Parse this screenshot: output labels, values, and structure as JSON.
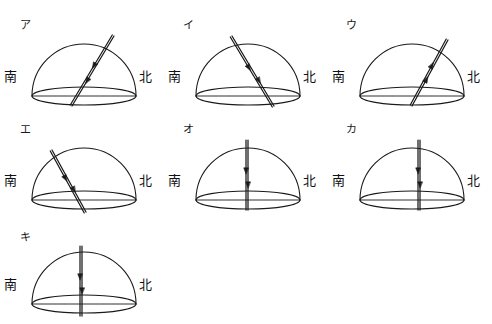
{
  "figure": {
    "title": "",
    "background_color": "#ffffff",
    "stroke_color": "#1a1a1a",
    "sheet_width": 492,
    "sheet_height": 324,
    "direction_labels": {
      "south": "南",
      "north": "北"
    },
    "options": [
      {
        "id": "a",
        "label": "ア",
        "label_x": 20,
        "label_y": 20,
        "cell_x": 0,
        "cell_y": 8,
        "path_description": "太陽の道すじが北寄りに高く傾き、南西下向きの矢印",
        "path_kind": "tilted-north-high",
        "arrow_direction": "down-left",
        "top_x": 114,
        "top_y": 28,
        "bottom_x": 72,
        "bottom_y": 98
      },
      {
        "id": "i",
        "label": "イ",
        "label_x": 183,
        "label_y": 20,
        "cell_x": 164,
        "cell_y": 8,
        "path_description": "太陽の道すじが南寄りに高く、北東下向きの矢印",
        "path_kind": "tilted-south-high",
        "arrow_direction": "down-right",
        "top_x": 68,
        "top_y": 28,
        "bottom_x": 110,
        "bottom_y": 98
      },
      {
        "id": "u",
        "label": "ウ",
        "label_x": 346,
        "label_y": 20,
        "cell_x": 328,
        "cell_y": 8,
        "path_description": "太陽の道すじが北寄りに高く、南西上向きの矢印",
        "path_kind": "tilted-north-high",
        "arrow_direction": "up-right",
        "top_x": 120,
        "top_y": 32,
        "bottom_x": 84,
        "bottom_y": 98
      },
      {
        "id": "e",
        "label": "エ",
        "label_x": 20,
        "label_y": 124,
        "cell_x": 0,
        "cell_y": 112,
        "path_description": "太陽の道すじが南寄りに低く、北東下向きの矢印",
        "path_kind": "tilted-south-low",
        "arrow_direction": "down-right",
        "top_x": 52,
        "top_y": 38,
        "bottom_x": 86,
        "bottom_y": 100
      },
      {
        "id": "o",
        "label": "オ",
        "label_x": 183,
        "label_y": 124,
        "cell_x": 164,
        "cell_y": 112,
        "path_description": "太陽の道すじが真上を通る鉛直線、下向きの矢印",
        "path_kind": "vertical-center",
        "arrow_direction": "down",
        "top_x": 84,
        "top_y": 28,
        "bottom_x": 84,
        "bottom_y": 98
      },
      {
        "id": "ka",
        "label": "カ",
        "label_x": 346,
        "label_y": 124,
        "cell_x": 328,
        "cell_y": 112,
        "path_description": "太陽の道すじが中心よりやや北寄りの鉛直線、下向きの矢印",
        "path_kind": "vertical-right",
        "arrow_direction": "down",
        "top_x": 92,
        "top_y": 28,
        "bottom_x": 92,
        "bottom_y": 98
      },
      {
        "id": "ki",
        "label": "キ",
        "label_x": 20,
        "label_y": 232,
        "cell_x": 0,
        "cell_y": 216,
        "path_description": "太陽の道すじが中心の鉛直線、下向きの矢印",
        "path_kind": "vertical-center",
        "arrow_direction": "down",
        "top_x": 82,
        "top_y": 30,
        "bottom_x": 82,
        "bottom_y": 100
      }
    ]
  }
}
